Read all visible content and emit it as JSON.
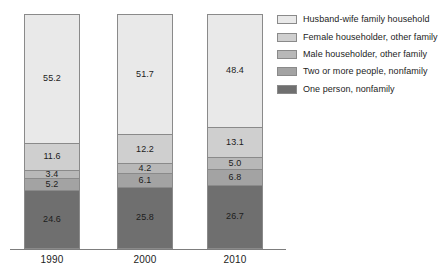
{
  "chart_data": {
    "type": "bar",
    "variant": "stacked-100-percent",
    "title": "",
    "subtitle": "",
    "xlabel": "",
    "ylabel": "",
    "ylim": [
      0,
      100
    ],
    "grid": false,
    "legend_position": "right",
    "categories": [
      "1990",
      "2000",
      "2010"
    ],
    "stack_order_top_to_bottom": [
      "Husband-wife family household",
      "Female householder, other family",
      "Male householder, other family",
      "Two or more people, nonfamily",
      "One person, nonfamily"
    ],
    "series": [
      {
        "name": "Husband-wife family household",
        "color": "#e9e9e9",
        "values": [
          55.2,
          51.7,
          48.4
        ],
        "labels": [
          "55.2",
          "51.7",
          "48.4"
        ]
      },
      {
        "name": "Female householder, other family",
        "color": "#cfcfcf",
        "values": [
          11.6,
          12.2,
          13.1
        ],
        "labels": [
          "11.6",
          "12.2",
          "13.1"
        ]
      },
      {
        "name": "Male householder, other family",
        "color": "#b8b8b8",
        "values": [
          3.4,
          4.2,
          5.0
        ],
        "labels": [
          "3.4",
          "4.2",
          "5.0"
        ]
      },
      {
        "name": "Two or more people, nonfamily",
        "color": "#a3a3a3",
        "values": [
          5.2,
          6.1,
          6.8
        ],
        "labels": [
          "5.2",
          "6.1",
          "6.8"
        ]
      },
      {
        "name": "One person, nonfamily",
        "color": "#6f6f6f",
        "values": [
          24.6,
          25.8,
          26.7
        ],
        "labels": [
          "24.6",
          "25.8",
          "26.7"
        ]
      }
    ]
  },
  "legend": {
    "items": [
      {
        "label": "Husband-wife family household",
        "color": "#e9e9e9"
      },
      {
        "label": "Female householder, other family",
        "color": "#cfcfcf"
      },
      {
        "label": "Male householder, other family",
        "color": "#b8b8b8"
      },
      {
        "label": "Two or more people, nonfamily",
        "color": "#a3a3a3"
      },
      {
        "label": "One person, nonfamily",
        "color": "#6f6f6f"
      }
    ]
  },
  "axis": {
    "tick_labels": [
      "1990",
      "2000",
      "2010"
    ],
    "line_color": "#7d7d7d"
  },
  "colors": {
    "background": "#ffffff",
    "text": "#1c1c1c",
    "outline": "#8a8a8a"
  }
}
